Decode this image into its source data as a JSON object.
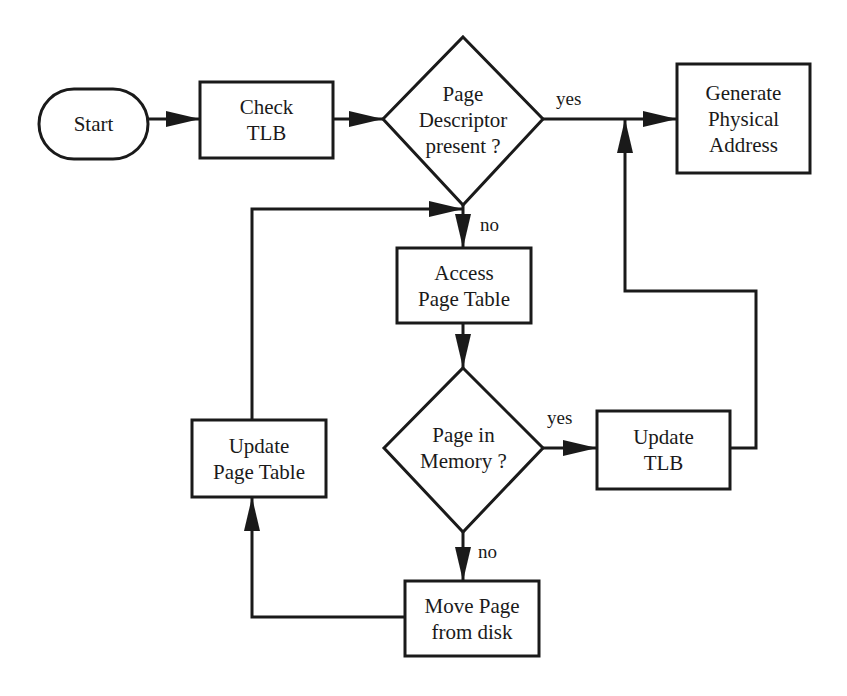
{
  "diagram": {
    "type": "flowchart",
    "stroke_color": "#1a1a1a",
    "background": "#ffffff",
    "nodes": {
      "start": {
        "shape": "terminator",
        "lines": [
          "Start"
        ]
      },
      "check_tlb": {
        "shape": "process",
        "lines": [
          "Check",
          "TLB"
        ]
      },
      "page_descriptor_present": {
        "shape": "decision",
        "lines": [
          "Page",
          "Descriptor",
          "present ?"
        ]
      },
      "generate_physical_address": {
        "shape": "process",
        "lines": [
          "Generate",
          "Physical",
          "Address"
        ]
      },
      "access_page_table": {
        "shape": "process",
        "lines": [
          "Access",
          "Page Table"
        ]
      },
      "page_in_memory": {
        "shape": "decision",
        "lines": [
          "Page in",
          "Memory ?"
        ]
      },
      "update_tlb": {
        "shape": "process",
        "lines": [
          "Update",
          "TLB"
        ]
      },
      "update_page_table": {
        "shape": "process",
        "lines": [
          "Update",
          "Page Table"
        ]
      },
      "move_page_from_disk": {
        "shape": "process",
        "lines": [
          "Move Page",
          "from disk"
        ]
      }
    },
    "edges": [
      {
        "from": "start",
        "to": "check_tlb",
        "label": ""
      },
      {
        "from": "check_tlb",
        "to": "page_descriptor_present",
        "label": ""
      },
      {
        "from": "page_descriptor_present",
        "to": "generate_physical_address",
        "label": "yes"
      },
      {
        "from": "page_descriptor_present",
        "to": "access_page_table",
        "label": "no"
      },
      {
        "from": "access_page_table",
        "to": "page_in_memory",
        "label": ""
      },
      {
        "from": "page_in_memory",
        "to": "update_tlb",
        "label": "yes"
      },
      {
        "from": "update_tlb",
        "to": "generate_physical_address",
        "label": ""
      },
      {
        "from": "page_in_memory",
        "to": "move_page_from_disk",
        "label": "no"
      },
      {
        "from": "move_page_from_disk",
        "to": "update_page_table",
        "label": ""
      },
      {
        "from": "update_page_table",
        "to": "access_page_table",
        "label": ""
      }
    ],
    "edge_labels": {
      "descriptor_yes": "yes",
      "descriptor_no": "no",
      "memory_yes": "yes",
      "memory_no": "no"
    }
  }
}
